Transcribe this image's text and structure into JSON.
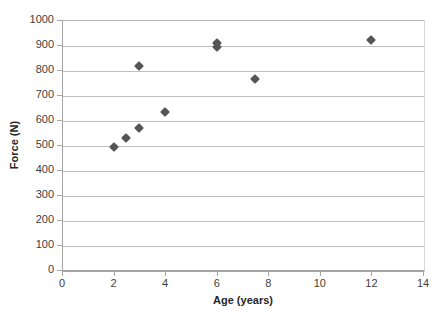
{
  "chart_data": {
    "type": "scatter",
    "title": "",
    "xlabel": "Age (years)",
    "ylabel": "Force (N)",
    "xlim": [
      0,
      14
    ],
    "ylim": [
      0,
      1000
    ],
    "xticks": [
      0,
      2,
      4,
      6,
      8,
      10,
      12,
      14
    ],
    "xtick_labels": [
      "0",
      "2",
      "4",
      "6",
      "8",
      "10",
      "12",
      "14"
    ],
    "yticks": [
      0,
      100,
      200,
      300,
      400,
      500,
      600,
      700,
      800,
      900,
      1000
    ],
    "ytick_labels": [
      "0",
      "100",
      "200",
      "300",
      "400",
      "500",
      "600",
      "700",
      "800",
      "900",
      "1000"
    ],
    "grid": "horizontal",
    "legend": "none",
    "marker_shape": "diamond",
    "marker_color": "#555555",
    "series": [
      {
        "name": "Force vs Age",
        "points": [
          {
            "x": 2.0,
            "y": 493
          },
          {
            "x": 2.5,
            "y": 530
          },
          {
            "x": 3.0,
            "y": 568
          },
          {
            "x": 3.0,
            "y": 815
          },
          {
            "x": 4.0,
            "y": 633
          },
          {
            "x": 6.0,
            "y": 893
          },
          {
            "x": 6.0,
            "y": 910
          },
          {
            "x": 7.5,
            "y": 763
          },
          {
            "x": 12.0,
            "y": 920
          }
        ]
      }
    ]
  },
  "axis_title_color": "#262626",
  "tick_label_color": "#404040",
  "gridline_color": "#BFBFBF",
  "plot_background": "#FFFFFF"
}
